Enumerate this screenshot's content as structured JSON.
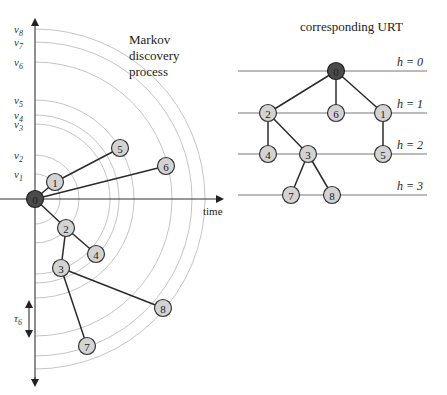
{
  "left_panel": {
    "title_lines": [
      "Markov",
      "discovery",
      "process"
    ],
    "x_axis_label": "time",
    "tau_label": "τ",
    "tau_subscript": "6",
    "arc_labels": [
      {
        "v": "v",
        "sub": "1",
        "radius": 25
      },
      {
        "v": "v",
        "sub": "2",
        "radius": 44
      },
      {
        "v": "v",
        "sub": "3",
        "radius": 75
      },
      {
        "v": "v",
        "sub": "4",
        "radius": 84
      },
      {
        "v": "v",
        "sub": "5",
        "radius": 99
      },
      {
        "v": "v",
        "sub": "6",
        "radius": 137
      },
      {
        "v": "v",
        "sub": "7",
        "radius": 157
      },
      {
        "v": "v",
        "sub": "8",
        "radius": 170
      }
    ],
    "nodes": [
      {
        "id": "0",
        "x": 35,
        "y": 199,
        "root": true
      },
      {
        "id": "1",
        "x": 55,
        "y": 182
      },
      {
        "id": "2",
        "x": 66,
        "y": 228
      },
      {
        "id": "3",
        "x": 61,
        "y": 268
      },
      {
        "id": "4",
        "x": 96,
        "y": 254
      },
      {
        "id": "5",
        "x": 120,
        "y": 148
      },
      {
        "id": "6",
        "x": 166,
        "y": 166
      },
      {
        "id": "7",
        "x": 87,
        "y": 346
      },
      {
        "id": "8",
        "x": 163,
        "y": 308
      }
    ],
    "edges": [
      [
        "0",
        "1"
      ],
      [
        "1",
        "5"
      ],
      [
        "0",
        "6"
      ],
      [
        "0",
        "2"
      ],
      [
        "2",
        "4"
      ],
      [
        "2",
        "3"
      ],
      [
        "3",
        "8"
      ],
      [
        "3",
        "7"
      ]
    ]
  },
  "right_panel": {
    "title": "corresponding URT",
    "levels": [
      {
        "label": "h = 0",
        "y": 71
      },
      {
        "label": "h = 1",
        "y": 113
      },
      {
        "label": "h = 2",
        "y": 154
      },
      {
        "label": "h = 3",
        "y": 195
      }
    ],
    "nodes": [
      {
        "id": "0",
        "x": 336,
        "y": 71,
        "root": true
      },
      {
        "id": "2",
        "x": 268,
        "y": 113
      },
      {
        "id": "6",
        "x": 336,
        "y": 113
      },
      {
        "id": "1",
        "x": 383,
        "y": 113
      },
      {
        "id": "4",
        "x": 268,
        "y": 154
      },
      {
        "id": "3",
        "x": 308,
        "y": 154
      },
      {
        "id": "5",
        "x": 383,
        "y": 154
      },
      {
        "id": "7",
        "x": 291,
        "y": 195
      },
      {
        "id": "8",
        "x": 332,
        "y": 195
      }
    ],
    "edges": [
      [
        "0",
        "2"
      ],
      [
        "0",
        "6"
      ],
      [
        "0",
        "1"
      ],
      [
        "2",
        "4"
      ],
      [
        "2",
        "3"
      ],
      [
        "1",
        "5"
      ],
      [
        "3",
        "7"
      ],
      [
        "3",
        "8"
      ]
    ]
  },
  "colors": {
    "node_fill": "#d3d3d3",
    "root_fill": "#4a4a4a",
    "edge": "#2b2b2b",
    "arc": "#bdbdbd"
  }
}
